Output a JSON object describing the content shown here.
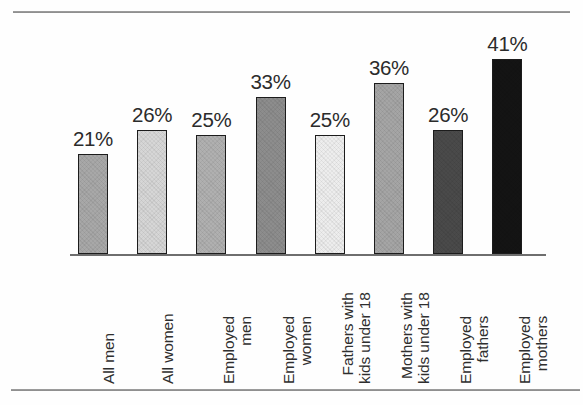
{
  "figure": {
    "background_color": "#fefefe",
    "rule_color": "#8a8a8a",
    "axis_color": "#6e6e6e",
    "label_color": "#2b2b2b"
  },
  "chart_data": {
    "type": "bar",
    "title": "",
    "xlabel": "",
    "ylabel": "",
    "ylim": [
      0,
      45
    ],
    "grid": false,
    "legend": "none",
    "value_suffix": "%",
    "categories": [
      "All men",
      "All women",
      "Employed men",
      "Employed women",
      "Fathers with kids under 18",
      "Mothers with kids under 18",
      "Employed fathers",
      "Employed mothers"
    ],
    "values": [
      21,
      26,
      25,
      33,
      25,
      36,
      26,
      41
    ],
    "value_labels": [
      "21%",
      "26%",
      "25%",
      "33%",
      "25%",
      "36%",
      "26%",
      "41%"
    ],
    "bars": [
      {
        "category": "All men",
        "label_lines": [
          "All men"
        ],
        "value": 21,
        "value_label": "21%",
        "fill": "#a8a8a8",
        "edge": "#1c1c1c"
      },
      {
        "category": "All women",
        "label_lines": [
          "All women"
        ],
        "value": 26,
        "value_label": "26%",
        "fill": "#d6d6d6",
        "edge": "#1c1c1c"
      },
      {
        "category": "Employed men",
        "label_lines": [
          "Employed",
          "men"
        ],
        "value": 25,
        "value_label": "25%",
        "fill": "#b0b0b0",
        "edge": "#1c1c1c"
      },
      {
        "category": "Employed women",
        "label_lines": [
          "Employed",
          "women"
        ],
        "value": 33,
        "value_label": "33%",
        "fill": "#8d8d8d",
        "edge": "#1c1c1c"
      },
      {
        "category": "Fathers with kids under 18",
        "label_lines": [
          "Fathers with",
          "kids under 18"
        ],
        "value": 25,
        "value_label": "25%",
        "fill": "#ededed",
        "edge": "#1c1c1c"
      },
      {
        "category": "Mothers with kids under 18",
        "label_lines": [
          "Mothers with",
          "kids under 18"
        ],
        "value": 36,
        "value_label": "36%",
        "fill": "#a5a5a5",
        "edge": "#1c1c1c"
      },
      {
        "category": "Employed fathers",
        "label_lines": [
          "Employed",
          "fathers"
        ],
        "value": 26,
        "value_label": "26%",
        "fill": "#4a4a4a",
        "edge": "#1c1c1c"
      },
      {
        "category": "Employed mothers",
        "label_lines": [
          "Employed",
          "mothers"
        ],
        "value": 41,
        "value_label": "41%",
        "fill": "#141414",
        "edge": "#1c1c1c"
      }
    ]
  }
}
